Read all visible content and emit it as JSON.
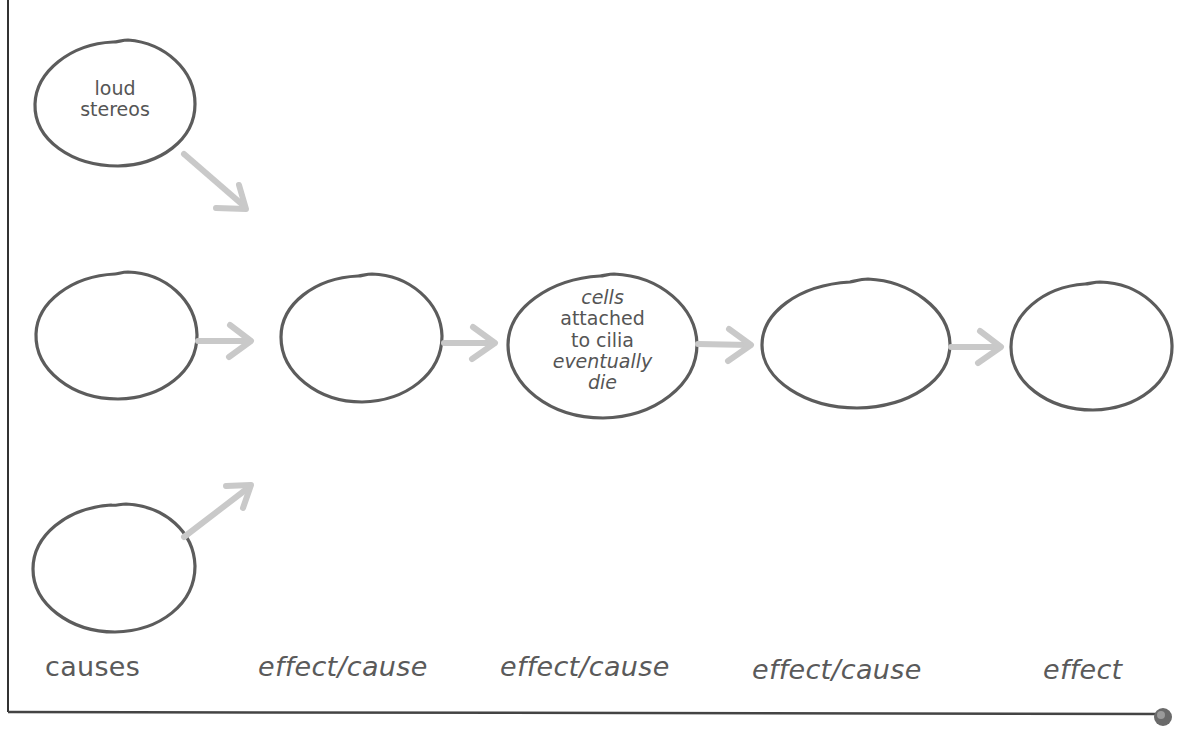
{
  "diagram": {
    "type": "cause-effect chain",
    "nodes": [
      {
        "id": "cause-top",
        "text_lines": [
          "loud",
          "stereos"
        ]
      },
      {
        "id": "cause-middle",
        "text_lines": []
      },
      {
        "id": "cause-bottom",
        "text_lines": []
      },
      {
        "id": "effect-cause-1",
        "text_lines": []
      },
      {
        "id": "effect-cause-2",
        "text_lines": [
          "cells",
          "attached",
          "to cilia",
          "eventually",
          "die"
        ]
      },
      {
        "id": "effect-cause-3",
        "text_lines": []
      },
      {
        "id": "effect-final",
        "text_lines": []
      }
    ],
    "edges": [
      {
        "from": "cause-top",
        "to": "effect-cause-1"
      },
      {
        "from": "cause-middle",
        "to": "effect-cause-1"
      },
      {
        "from": "cause-bottom",
        "to": "effect-cause-1"
      },
      {
        "from": "effect-cause-1",
        "to": "effect-cause-2"
      },
      {
        "from": "effect-cause-2",
        "to": "effect-cause-3"
      },
      {
        "from": "effect-cause-3",
        "to": "effect-final"
      }
    ],
    "column_labels": [
      "causes",
      "effect/cause",
      "effect/cause",
      "effect/cause",
      "effect"
    ]
  },
  "colors": {
    "circle_stroke": "#5c5c5c",
    "arrow": "#c9c9c9",
    "text": "#555555",
    "frame": "#333333"
  }
}
